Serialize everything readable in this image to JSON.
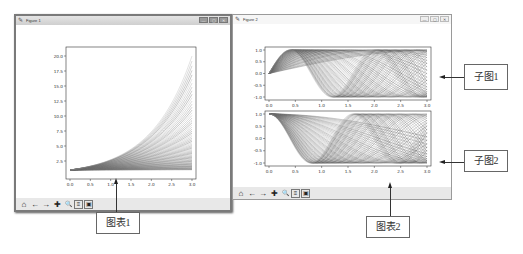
{
  "windows": [
    {
      "title": "Figure 1",
      "icon": "matplotlib-icon",
      "controls": [
        "—",
        "▢",
        "✕"
      ]
    },
    {
      "title": "Figure 2",
      "icon": "matplotlib-icon",
      "controls": [
        "—",
        "▢",
        "✕"
      ]
    }
  ],
  "toolbar": {
    "items": [
      {
        "name": "home",
        "glyph": "⌂"
      },
      {
        "name": "back",
        "glyph": "←"
      },
      {
        "name": "forward",
        "glyph": "→"
      },
      {
        "name": "pan",
        "glyph": "✚"
      },
      {
        "name": "zoom",
        "glyph": "🔍"
      },
      {
        "name": "subplots",
        "glyph": "≡"
      },
      {
        "name": "save",
        "glyph": "▣"
      }
    ]
  },
  "callouts": {
    "chart1": "图表1",
    "chart2": "图表2",
    "sub1": "子图1",
    "sub2": "子图2"
  },
  "chart_data": [
    {
      "type": "line",
      "title": "",
      "xlabel": "",
      "ylabel": "",
      "x_ticks": [
        "0.0",
        "0.5",
        "1.0",
        "1.5",
        "2.0",
        "2.5",
        "3.0"
      ],
      "y_ticks": [
        "2.5",
        "5.0",
        "7.5",
        "10.0",
        "12.5",
        "15.0",
        "17.5",
        "20.0"
      ],
      "xlim": [
        0,
        3
      ],
      "ylim": [
        0,
        21
      ],
      "description": "Family of exponential curves y = exp(k·x) fanning from y≈1 at x=0 up to ≈20 at x=3",
      "series_count": "many",
      "grid": false
    },
    {
      "type": "line",
      "title": "",
      "subplot": "top",
      "x_ticks": [
        "0.0",
        "0.5",
        "1.0",
        "1.5",
        "2.0",
        "2.5",
        "3.0"
      ],
      "y_ticks": [
        "-1.0",
        "-0.5",
        "0.0",
        "0.5",
        "1.0"
      ],
      "xlim": [
        0,
        3
      ],
      "ylim": [
        -1,
        1
      ],
      "description": "Family of sine curves sin(k·x) with varying frequency, starting at 0",
      "grid": false
    },
    {
      "type": "line",
      "title": "",
      "subplot": "bottom",
      "x_ticks": [
        "0.0",
        "0.5",
        "1.0",
        "1.5",
        "2.0",
        "2.5",
        "3.0"
      ],
      "y_ticks": [
        "-1.0",
        "-0.5",
        "0.0",
        "0.5",
        "1.0"
      ],
      "xlim": [
        0,
        3
      ],
      "ylim": [
        -1,
        1
      ],
      "description": "Family of cosine curves cos(k·x) with varying frequency, starting at 1",
      "grid": false
    }
  ]
}
